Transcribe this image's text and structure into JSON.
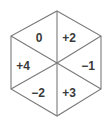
{
  "diagram": {
    "shape": "hexagon",
    "colors": {
      "line": "#7a7a7a",
      "text": "#3a3a3a",
      "background": "#ffffff"
    },
    "segments": [
      {
        "position": "top-left",
        "label": "0"
      },
      {
        "position": "top-right",
        "label": "+2"
      },
      {
        "position": "right",
        "label": "−1"
      },
      {
        "position": "bottom-right",
        "label": "+3"
      },
      {
        "position": "bottom-left",
        "label": "−2"
      },
      {
        "position": "left",
        "label": "+4"
      }
    ]
  }
}
